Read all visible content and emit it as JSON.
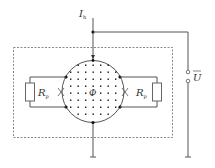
{
  "diagram": {
    "type": "circuit",
    "labels": {
      "current": "I",
      "current_sub": "h",
      "flux": "Φ",
      "resistor_left": "R",
      "resistor_left_sub": "p",
      "resistor_right": "R",
      "resistor_right_sub": "p",
      "voltage": "U"
    },
    "colors": {
      "line": "#555555",
      "dashed_box": "#888888",
      "dot": "#111111",
      "resistor": "#666666"
    },
    "components": [
      {
        "id": "hall-disk",
        "shape": "circle",
        "content": "magnetic flux dots"
      },
      {
        "id": "resistor-left",
        "label": "Rp"
      },
      {
        "id": "resistor-right",
        "label": "Rp"
      },
      {
        "id": "voltage-terminals",
        "label": "U"
      },
      {
        "id": "shield-box",
        "style": "dashed"
      }
    ]
  }
}
